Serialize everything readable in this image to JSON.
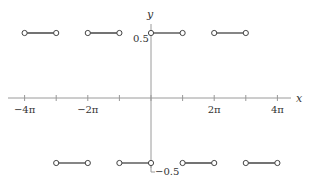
{
  "chart_data": {
    "type": "line",
    "title": "",
    "xlabel": "x",
    "ylabel": "y",
    "x_ticks": [
      -12.566,
      -9.425,
      -6.283,
      -3.142,
      0,
      3.142,
      6.283,
      9.425,
      12.566
    ],
    "x_tick_labels": [
      "−4π",
      "",
      "−2π",
      "",
      "",
      "",
      "2π",
      "",
      "4π"
    ],
    "y_tick_labels": {
      "top": "0.5",
      "bottom": "−0.5"
    },
    "y_ticks": [
      0.5,
      -0.5
    ],
    "xlim": [
      -4.5,
      4.5
    ],
    "xlim_units": "π",
    "ylim": [
      -0.5,
      0.5
    ],
    "grid": false,
    "segments": [
      {
        "x_start_pi": -4,
        "x_end_pi": -3,
        "y": 0.5,
        "endpoints": "open"
      },
      {
        "x_start_pi": -3,
        "x_end_pi": -2,
        "y": -0.5,
        "endpoints": "open"
      },
      {
        "x_start_pi": -2,
        "x_end_pi": -1,
        "y": 0.5,
        "endpoints": "open"
      },
      {
        "x_start_pi": -1,
        "x_end_pi": 0,
        "y": -0.5,
        "endpoints": "open"
      },
      {
        "x_start_pi": 0,
        "x_end_pi": 1,
        "y": 0.5,
        "endpoints": "open"
      },
      {
        "x_start_pi": 1,
        "x_end_pi": 2,
        "y": -0.5,
        "endpoints": "open"
      },
      {
        "x_start_pi": 2,
        "x_end_pi": 3,
        "y": 0.5,
        "endpoints": "open"
      },
      {
        "x_start_pi": 3,
        "x_end_pi": 4,
        "y": -0.5,
        "endpoints": "open"
      }
    ]
  },
  "style": {
    "axis_color": "#999999",
    "segment_color": "#444444",
    "marker_fill": "#ffffff"
  }
}
